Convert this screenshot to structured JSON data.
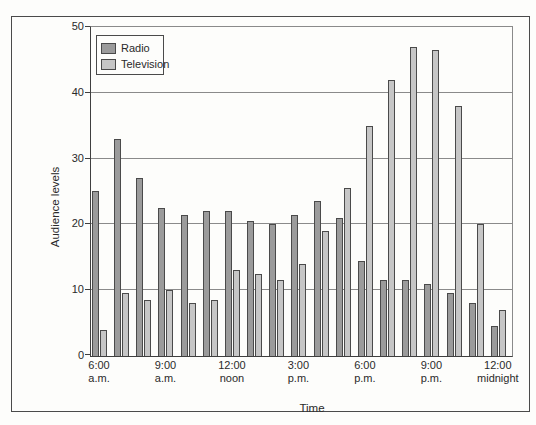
{
  "colors": {
    "background": "#fdfdfb",
    "frame": "#4a4a4a",
    "axis": "#3f3f3f",
    "gridline": "#8a8a8a",
    "bar_outline": "#4a4a4a",
    "radio_fill": "#9b9b9b",
    "television_fill": "#c6c6c6",
    "text": "#2a2a2a"
  },
  "chart_data": {
    "type": "bar",
    "title": "",
    "xlabel": "Time",
    "ylabel": "Audience levels",
    "ylim": [
      0,
      50
    ],
    "yticks": [
      0,
      10,
      20,
      30,
      40,
      50
    ],
    "grid": true,
    "legend_position": "top-left",
    "categories": [
      "6:00 a.m.",
      "7:00 a.m.",
      "8:00 a.m.",
      "9:00 a.m.",
      "10:00 a.m.",
      "11:00 a.m.",
      "12:00 noon",
      "1:00 p.m.",
      "2:00 p.m.",
      "3:00 p.m.",
      "4:00 p.m.",
      "5:00 p.m.",
      "6:00 p.m.",
      "7:00 p.m.",
      "8:00 p.m.",
      "9:00 p.m.",
      "10:00 p.m.",
      "11:00 p.m.",
      "12:00 midnight"
    ],
    "x_axis_ticks": [
      {
        "at": 0,
        "lines": [
          "6:00",
          "a.m."
        ]
      },
      {
        "at": 3,
        "lines": [
          "9:00",
          "a.m."
        ]
      },
      {
        "at": 6,
        "lines": [
          "12:00",
          "noon"
        ]
      },
      {
        "at": 9,
        "lines": [
          "3:00",
          "p.m."
        ]
      },
      {
        "at": 12,
        "lines": [
          "6:00",
          "p.m."
        ]
      },
      {
        "at": 15,
        "lines": [
          "9:00",
          "p.m."
        ]
      },
      {
        "at": 18,
        "lines": [
          "12:00",
          "midnight"
        ]
      }
    ],
    "series": [
      {
        "name": "Radio",
        "color": "#9b9b9b",
        "values": [
          25,
          33,
          27,
          22.5,
          21.5,
          22,
          22,
          20.5,
          20,
          21.5,
          23.5,
          21,
          14.5,
          11.5,
          11.5,
          11,
          9.5,
          8,
          4.5
        ]
      },
      {
        "name": "Television",
        "color": "#c6c6c6",
        "values": [
          4,
          9.5,
          8.5,
          10,
          8,
          8.5,
          13,
          12.5,
          11.5,
          14,
          19,
          25.5,
          35,
          42,
          47,
          46.5,
          38,
          20,
          7
        ]
      }
    ]
  }
}
